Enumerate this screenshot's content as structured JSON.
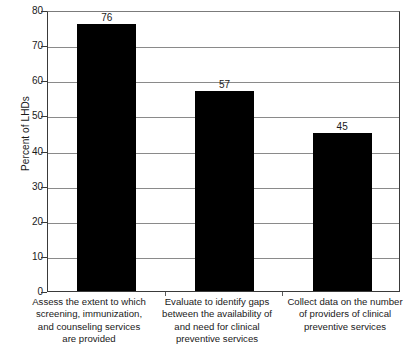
{
  "chart_data": {
    "type": "bar",
    "title": "",
    "subtitle": "",
    "xlabel": "",
    "ylabel": "Percent of LHDs",
    "ylim": [
      0,
      80
    ],
    "ytick_step": 10,
    "yticks": [
      0,
      10,
      20,
      30,
      40,
      50,
      60,
      70,
      80
    ],
    "grid": true,
    "grid_axis": "y",
    "legend": false,
    "legend_position": "none",
    "bar_color": "#000000",
    "categories": [
      "Assess the extent to which screening, immunization, and counseling services are provided",
      "Evaluate to identify gaps between the availability of and need for clinical preventive services",
      "Collect data on the number of providers of clinical preventive services"
    ],
    "category_lines": [
      [
        "Assess the extent to which",
        "screening, immunization,",
        "and counseling services",
        "are provided"
      ],
      [
        "Evaluate to identify gaps",
        "between the availability of",
        "and need for clinical",
        "preventive services"
      ],
      [
        "Collect data on the number",
        "of providers of clinical",
        "preventive services"
      ]
    ],
    "values": [
      76,
      57,
      45
    ],
    "value_labels": [
      "76",
      "57",
      "45"
    ]
  },
  "axes": {
    "y_title": "Percent of LHDs",
    "y_tick_labels": [
      "80",
      "70",
      "60",
      "50",
      "40",
      "30",
      "20",
      "10",
      "0"
    ]
  }
}
